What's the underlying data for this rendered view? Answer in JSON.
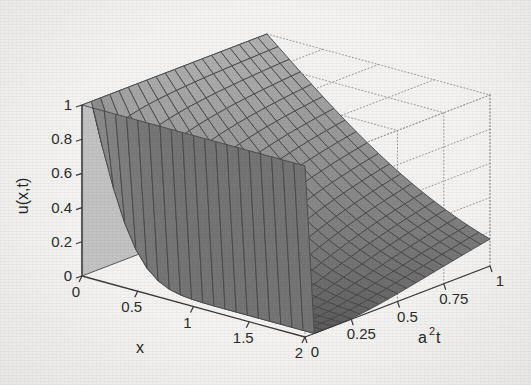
{
  "chart_data": {
    "type": "surface",
    "title": "",
    "xlabel": "x",
    "ylabel": "a2t",
    "ylabel_display": "a",
    "ylabel_sup": "2",
    "ylabel_tail": "t",
    "zlabel": "u(x,t)",
    "xlim": [
      0,
      2
    ],
    "ylim": [
      0,
      1
    ],
    "zlim": [
      0,
      1
    ],
    "xticks": [
      0,
      0.5,
      1,
      1.5,
      2
    ],
    "xticklabels": [
      "0",
      "0.5",
      "1",
      "1.5",
      "2"
    ],
    "yticks": [
      0,
      0.25,
      0.5,
      0.75,
      1
    ],
    "yticklabels": [
      "0",
      "0.25",
      "0.5",
      "0.75",
      "1"
    ],
    "zticks": [
      0,
      0.2,
      0.4,
      0.6,
      0.8,
      1
    ],
    "zticklabels": [
      "0",
      "0.2",
      "0.4",
      "0.6",
      "0.8",
      "1"
    ],
    "grid": "dotted-back-planes",
    "legend": "none",
    "colormap": "gray",
    "mesh_nx": 21,
    "mesh_ny": 21,
    "surface_model": "u = exp(-0.92*x*sqrt(t*3.2+0.012)*6.2/(1+2.1*x)) style decaying front; u(0,t)=1, u(x,0)=1 for x>0 with sharp boundary layer",
    "z_values_note": "Values computed in template from erfc-like profile u(x,t)=erfc(x/(2*sqrt(a2t))) clipped to [0,1]",
    "sample_points": [
      {
        "x": 0.0,
        "t": 0.0,
        "u": 1.0
      },
      {
        "x": 0.0,
        "t": 1.0,
        "u": 1.0
      },
      {
        "x": 0.5,
        "t": 0.0,
        "u": 1.0
      },
      {
        "x": 0.5,
        "t": 0.25,
        "u": 0.48
      },
      {
        "x": 0.5,
        "t": 1.0,
        "u": 0.26
      },
      {
        "x": 1.0,
        "t": 0.25,
        "u": 0.16
      },
      {
        "x": 1.0,
        "t": 1.0,
        "u": 0.05
      },
      {
        "x": 2.0,
        "t": 1.0,
        "u": 0.0
      },
      {
        "x": 2.0,
        "t": 0.0,
        "u": 0.0
      }
    ]
  },
  "colors": {
    "background": "#f4f3f1",
    "axis": "#3a3a3a",
    "text": "#2b2b2b",
    "mesh_line": "#4a4a4a",
    "surface_light": "#c2c2c2",
    "surface_mid": "#8e8e8e",
    "surface_dark": "#5d5d5d",
    "gridline_dotted": "#9a9a9a"
  },
  "axes": {
    "x_axis_name": "x",
    "z_axis_name": "u(x,t)",
    "y_axis_name_base": "a",
    "y_axis_name_exp": "2",
    "y_axis_name_suffix": "t"
  },
  "ticks": {
    "x": [
      "0",
      "0.5",
      "1",
      "1.5",
      "2"
    ],
    "y": [
      "0",
      "0.25",
      "0.5",
      "0.75",
      "1"
    ],
    "z": [
      "0",
      "0.2",
      "0.4",
      "0.6",
      "0.8",
      "1"
    ]
  }
}
